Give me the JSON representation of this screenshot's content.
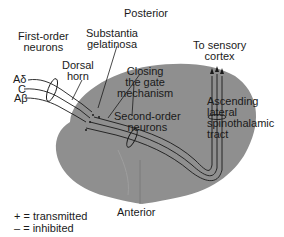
{
  "diagram": {
    "labels": {
      "posterior": "Posterior",
      "anterior": "Anterior",
      "first_order_1": "First-order",
      "first_order_2": "neurons",
      "substantia_1": "Substantia",
      "substantia_2": "gelatinosa",
      "dorsal_1": "Dorsal",
      "dorsal_2": "horn",
      "closing_1": "Closing",
      "closing_2": "the gate",
      "closing_3": "mechanism",
      "second_order_1": "Second-order",
      "second_order_2": "neurons",
      "sensory_1": "To sensory",
      "sensory_2": "cortex",
      "ascending_1": "Ascending",
      "ascending_2": "lateral",
      "ascending_3": "spinothalamic",
      "ascending_4": "tract"
    },
    "fibers": [
      "Aδ",
      "C",
      "Aβ"
    ],
    "legend": [
      {
        "symbol": "+",
        "text": "= transmitted"
      },
      {
        "symbol": "–",
        "text": "= inhibited"
      }
    ],
    "colors": {
      "spinal_cord": "#8f8f8f",
      "lines": "#1a1a1a",
      "background": "#ffffff"
    }
  }
}
